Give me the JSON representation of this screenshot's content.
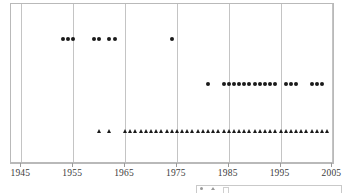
{
  "chart_data": {
    "type": "scatter",
    "title": "",
    "subtitle": "",
    "xlabel": "",
    "ylabel": "",
    "xlim": [
      1943,
      2005.5
    ],
    "ylim": [
      0,
      3
    ],
    "grid": "vertical gridlines at each x tick",
    "legend_position": "below plot, right",
    "xticks": [
      1945,
      1955,
      1965,
      1975,
      1985,
      1995,
      2005
    ],
    "xticklabels": [
      "1945",
      "1955",
      "1965",
      "1975",
      "1985",
      "1995",
      "2005"
    ],
    "yticks": [],
    "yticklabels": [],
    "series": [
      {
        "name": "series-top",
        "marker": "circle",
        "color": "#1a1a1a",
        "y_level": 2.35,
        "x": [
          1953,
          1954,
          1955,
          1959,
          1960,
          1962,
          1963,
          1974
        ],
        "values": [
          2.35,
          2.35,
          2.35,
          2.35,
          2.35,
          2.35,
          2.35,
          2.35
        ]
      },
      {
        "name": "series-middle",
        "marker": "circle",
        "color": "#1a1a1a",
        "y_level": 1.5,
        "x": [
          1981,
          1984,
          1985,
          1986,
          1987,
          1988,
          1989,
          1990,
          1991,
          1992,
          1993,
          1994,
          1996,
          1997,
          1998,
          2001,
          2002,
          2003
        ],
        "values": [
          1.5,
          1.5,
          1.5,
          1.5,
          1.5,
          1.5,
          1.5,
          1.5,
          1.5,
          1.5,
          1.5,
          1.5,
          1.5,
          1.5,
          1.5,
          1.5,
          1.5,
          1.5
        ]
      },
      {
        "name": "series-bottom",
        "marker": "triangle",
        "color": "#1a1a1a",
        "y_level": 0.62,
        "x": [
          1960,
          1962,
          1965,
          1966,
          1967,
          1968,
          1969,
          1970,
          1971,
          1972,
          1973,
          1974,
          1975,
          1976,
          1977,
          1978,
          1979,
          1980,
          1981,
          1982,
          1983,
          1984,
          1985,
          1986,
          1987,
          1988,
          1989,
          1990,
          1991,
          1992,
          1993,
          1994,
          1995,
          1996,
          1997,
          1998,
          1999,
          2000,
          2001,
          2002,
          2003,
          2004
        ],
        "values": [
          0.62,
          0.62,
          0.62,
          0.62,
          0.62,
          0.62,
          0.62,
          0.62,
          0.62,
          0.62,
          0.62,
          0.62,
          0.62,
          0.62,
          0.62,
          0.62,
          0.62,
          0.62,
          0.62,
          0.62,
          0.62,
          0.62,
          0.62,
          0.62,
          0.62,
          0.62,
          0.62,
          0.62,
          0.62,
          0.62,
          0.62,
          0.62,
          0.62,
          0.62,
          0.62,
          0.62,
          0.62,
          0.62,
          0.62,
          0.62,
          0.62,
          0.62
        ]
      }
    ],
    "legend_entries": [
      {
        "label": "",
        "marker": "circle"
      },
      {
        "label": "",
        "marker": "triangle"
      },
      {
        "label": "",
        "marker": "box"
      }
    ]
  },
  "colors": {
    "marker": "#1a1a1a",
    "grid": "#c4c4c4",
    "frame": "#b9b9b9",
    "tick_label": "#3b3b3b",
    "legend_border": "#c9c9c9"
  }
}
